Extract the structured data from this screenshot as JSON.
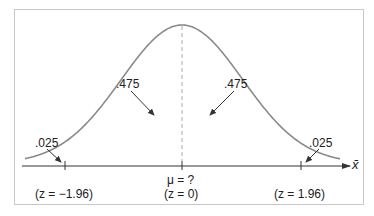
{
  "figure": {
    "type": "normal-distribution-diagram",
    "center_label": "μ = ?",
    "center_z_label": "(z = 0)",
    "left_z_label": "(z = −1.96)",
    "right_z_label": "(z = 1.96)",
    "axis_label": "x̄",
    "areas": {
      "left_center": ".475",
      "right_center": ".475",
      "left_tail": ".025",
      "right_tail": ".025"
    },
    "colors": {
      "curve": "#8a8a8a",
      "axis": "#333333",
      "dashed": "#aaaaaa",
      "frame": "#c8c8c8",
      "text": "#222222"
    }
  },
  "chart_data": {
    "type": "line",
    "title": "",
    "xlabel": "x̄",
    "ylabel": "",
    "x_ticks": [
      {
        "z": -1.96,
        "label": "(z = −1.96)"
      },
      {
        "z": 0,
        "label": "μ = ? (z = 0)"
      },
      {
        "z": 1.96,
        "label": "(z = 1.96)"
      }
    ],
    "regions": [
      {
        "name": "left tail",
        "area": 0.025,
        "label": ".025"
      },
      {
        "name": "left center",
        "area": 0.475,
        "label": ".475"
      },
      {
        "name": "right center",
        "area": 0.475,
        "label": ".475"
      },
      {
        "name": "right tail",
        "area": 0.025,
        "label": ".025"
      }
    ],
    "grid": false,
    "legend": false
  }
}
